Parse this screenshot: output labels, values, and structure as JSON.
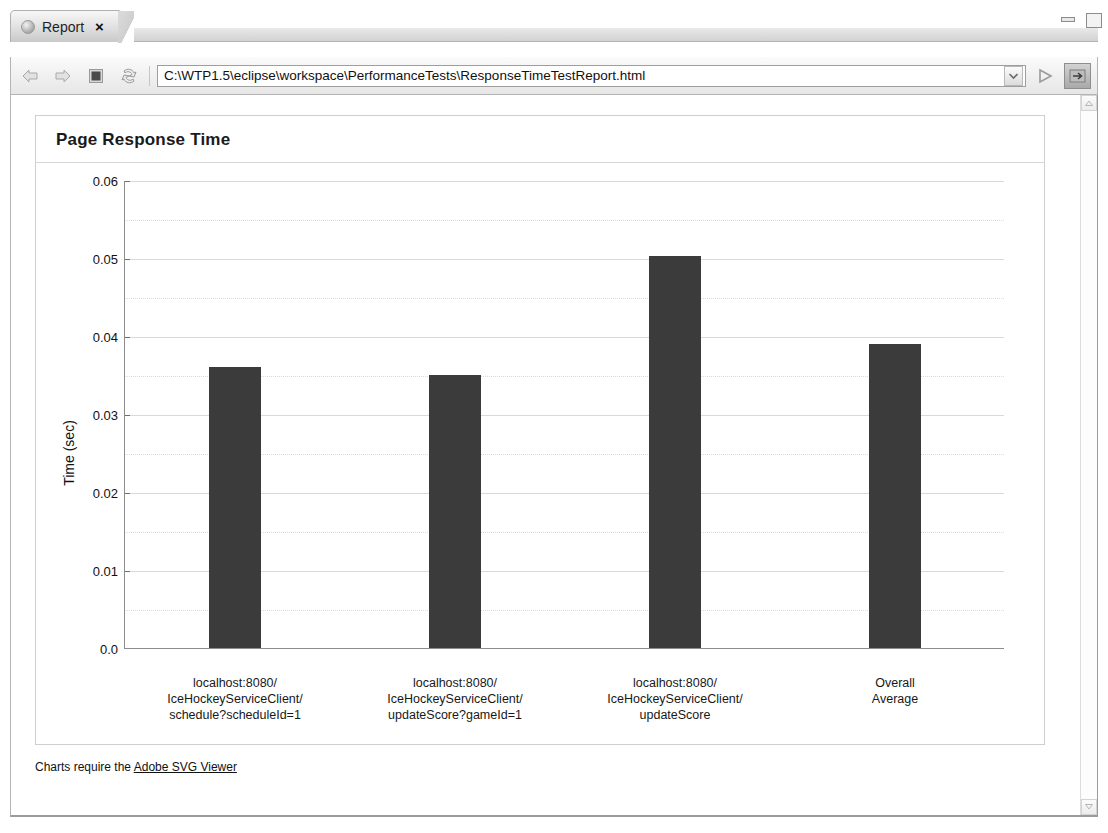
{
  "window": {
    "tab": {
      "label": "Report",
      "icon": "globe-icon",
      "close_label": "×"
    },
    "controls": {
      "minimize_label": "Minimize",
      "maximize_label": "Maximize"
    }
  },
  "toolbar": {
    "back_label": "Back",
    "forward_label": "Forward",
    "stop_label": "Stop",
    "refresh_label": "Refresh",
    "url_value": "C:\\WTP1.5\\eclipse\\workspace\\PerformanceTests\\ResponseTimeTestReport.html",
    "url_placeholder": "Enter address",
    "dropdown_label": "⌄",
    "go_label": "Go",
    "open_external_label": "Open in external browser"
  },
  "scrollbar": {
    "up_label": "▲",
    "down_label": "▼"
  },
  "report": {
    "title": "Page Response Time",
    "footer_prefix": "Charts require the ",
    "footer_link": "Adobe SVG Viewer"
  },
  "chart_data": {
    "type": "bar",
    "title": "Page Response Time",
    "xlabel": "",
    "ylabel": "Time (sec)",
    "ylim": [
      0.0,
      0.06
    ],
    "grid": true,
    "legend": "none",
    "bar_color": "#3b3b3b",
    "categories": [
      "localhost:8080/\nIceHockeyServiceClient/\nschedule?scheduleId=1",
      "localhost:8080/\nIceHockeyServiceClient/\nupdateScore?gameId=1",
      "localhost:8080/\nIceHockeyServiceClient/\nupdateScore",
      "Overall\nAverage"
    ],
    "category_lines": [
      [
        "localhost:8080/",
        "IceHockeyServiceClient/",
        "schedule?scheduleId=1"
      ],
      [
        "localhost:8080/",
        "IceHockeyServiceClient/",
        "updateScore?gameId=1"
      ],
      [
        "localhost:8080/",
        "IceHockeyServiceClient/",
        "updateScore"
      ],
      [
        "Overall",
        "Average"
      ]
    ],
    "values": [
      0.036,
      0.035,
      0.0502,
      0.039
    ],
    "yticks": [
      0.0,
      0.01,
      0.02,
      0.03,
      0.04,
      0.05,
      0.06
    ],
    "ytick_labels": [
      "0.0",
      "0.01",
      "0.02",
      "0.03",
      "0.04",
      "0.05",
      "0.06"
    ],
    "minor_yticks": [
      0.005,
      0.015,
      0.025,
      0.035,
      0.045,
      0.055
    ]
  }
}
